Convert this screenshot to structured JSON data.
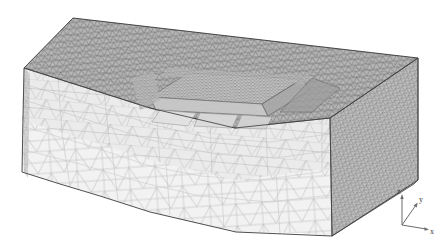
{
  "figure": {
    "type": "3d-tetrahedral-finite-element-mesh",
    "background_color": "#ffffff",
    "projection": "isometric-like perspective, viewed from upper-left-front"
  },
  "layers": [
    {
      "name": "top-surface-layer",
      "label": "fine-mesh top layer",
      "fill_color": "#b4b4b4",
      "line_color": "#5a5a5a",
      "density": "fine"
    },
    {
      "name": "upper-body-layer",
      "label": "mid coarse layer",
      "fill_color": "#ededed",
      "line_color": "#a8a8a8",
      "density": "coarse"
    },
    {
      "name": "lower-body-layer",
      "label": "lower coarse layer",
      "fill_color": "#f4f4f4",
      "line_color": "#b0b0b0",
      "density": "coarse"
    },
    {
      "name": "right-side-face",
      "label": "right lateral face",
      "fill_color": "#bdbdbd",
      "line_color": "#6a6a6a",
      "density": "fine"
    }
  ],
  "feature": {
    "name": "excavation-trench",
    "label": "rectangular refined excavation region",
    "mesh_density": "very fine",
    "fill_color": "#cfcfcf",
    "line_color": "#707070"
  },
  "axis_triad": {
    "name": "coordinate-axes",
    "origin_label": "",
    "axes": [
      {
        "key": "z",
        "label": "z",
        "direction": "up"
      },
      {
        "key": "y",
        "label": "y",
        "direction": "upper-right"
      },
      {
        "key": "x",
        "label": "x",
        "direction": "right"
      }
    ],
    "line_color": "#6b6b6b",
    "text_color": "#3a3a3a"
  }
}
